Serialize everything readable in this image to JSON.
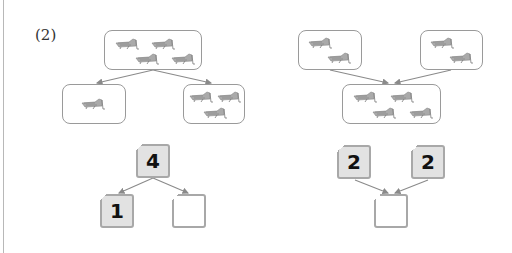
{
  "problem_label": "(2)",
  "left_diagram": {
    "picture_top": {
      "count": 4,
      "icon": "grasshopper-icon"
    },
    "picture_left": {
      "count": 1,
      "icon": "grasshopper-icon"
    },
    "picture_right": {
      "count": 3,
      "icon": "grasshopper-icon"
    },
    "number_top": "4",
    "number_left": "1",
    "number_right": ""
  },
  "right_diagram": {
    "picture_left": {
      "count": 2,
      "icon": "grasshopper-icon"
    },
    "picture_right": {
      "count": 2,
      "icon": "grasshopper-icon"
    },
    "picture_bottom": {
      "count": 4,
      "icon": "grasshopper-icon"
    },
    "number_left": "2",
    "number_right": "2",
    "number_bottom": ""
  },
  "colors": {
    "box_border": "#9a9a9a",
    "number_fill": "#e2e2e2",
    "arrow": "#8a8a8a"
  }
}
